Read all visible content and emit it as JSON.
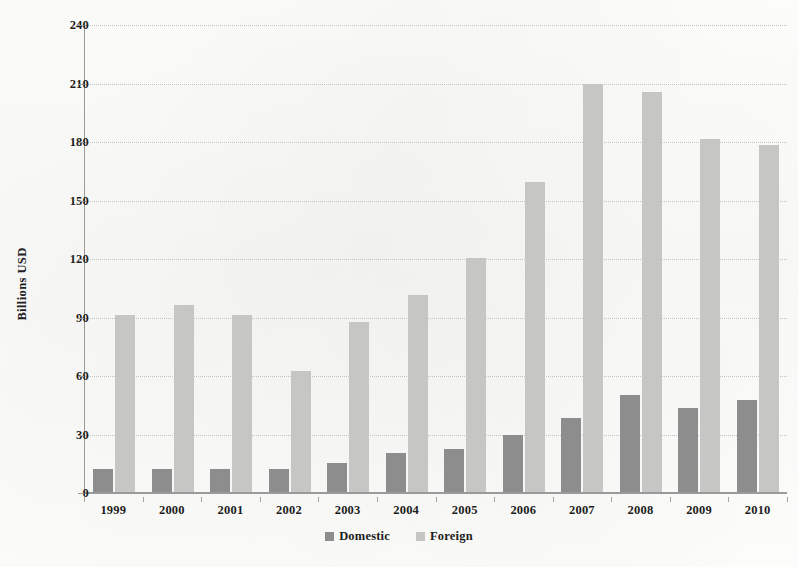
{
  "chart_data": {
    "type": "bar",
    "title": "",
    "xlabel": "",
    "ylabel": "Billions USD",
    "categories": [
      "1999",
      "2000",
      "2001",
      "2002",
      "2003",
      "2004",
      "2005",
      "2006",
      "2007",
      "2008",
      "2009",
      "2010"
    ],
    "series": [
      {
        "name": "Domestic",
        "color": "#8d8d8d",
        "values": [
          12,
          12,
          12,
          12,
          15,
          20,
          22,
          29,
          38,
          50,
          43,
          47
        ]
      },
      {
        "name": "Foreign",
        "color": "#c6c6c5",
        "values": [
          91,
          96,
          91,
          62,
          87,
          101,
          120,
          159,
          209,
          205,
          181,
          178
        ]
      }
    ],
    "ylim": [
      0,
      240
    ],
    "ytick_step": 30,
    "yticks": [
      "240",
      "210",
      "180",
      "150",
      "120",
      "90",
      "60",
      "30",
      "0"
    ],
    "ytick_values": [
      240,
      210,
      180,
      150,
      120,
      90,
      60,
      30,
      0
    ],
    "grid": true,
    "grid_axis": "y",
    "legend_position": "bottom",
    "legend": [
      "Domestic",
      "Foreign"
    ]
  }
}
